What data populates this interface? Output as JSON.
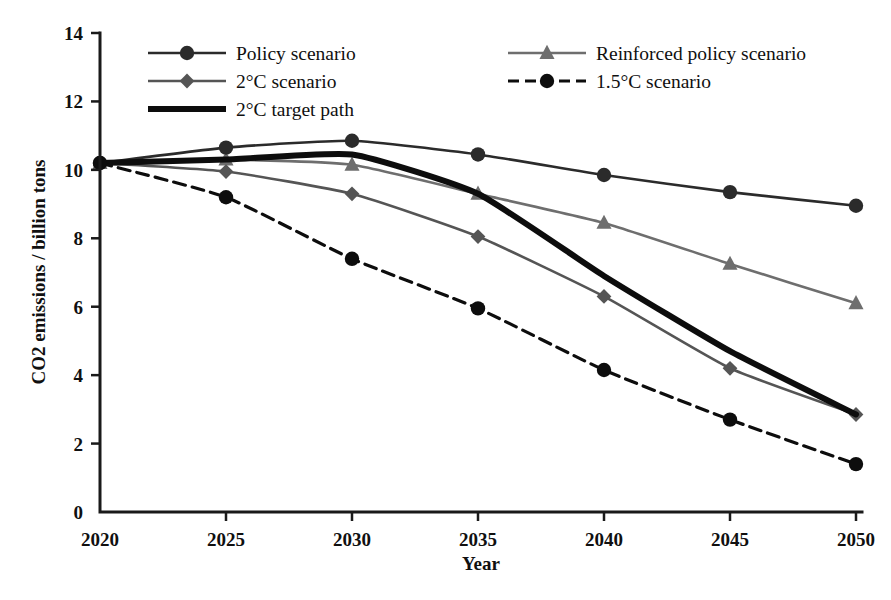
{
  "chart_data": {
    "type": "line",
    "title": "",
    "xlabel": "Year",
    "ylabel": "CO2 emissions / billion tons",
    "x": [
      2020,
      2025,
      2030,
      2035,
      2040,
      2045,
      2050
    ],
    "xticklabels": [
      "2020",
      "2025",
      "2030",
      "2035",
      "2040",
      "2045",
      "2050"
    ],
    "yticklabels": [
      "0",
      "2",
      "4",
      "6",
      "8",
      "10",
      "12",
      "14"
    ],
    "yticks": [
      0,
      2,
      4,
      6,
      8,
      10,
      12,
      14
    ],
    "xlim": [
      2020,
      2050
    ],
    "ylim": [
      0,
      14
    ],
    "grid": false,
    "legend_position": "top-inside",
    "series": [
      {
        "name": "Policy scenario",
        "values": [
          10.2,
          10.65,
          10.85,
          10.45,
          9.85,
          9.35,
          8.95
        ],
        "color": "#2b2b2b",
        "marker": "circle",
        "dash": "none",
        "width": 2.6
      },
      {
        "name": "Reinforced policy scenario",
        "values": [
          10.2,
          10.3,
          10.15,
          9.3,
          8.45,
          7.25,
          6.1
        ],
        "color": "#6e6e6e",
        "marker": "triangle",
        "dash": "none",
        "width": 2.6
      },
      {
        "name": "2°C scenario",
        "values": [
          10.2,
          9.95,
          9.3,
          8.05,
          6.3,
          4.2,
          2.85
        ],
        "color": "#555555",
        "marker": "diamond",
        "dash": "none",
        "width": 2.6
      },
      {
        "name": "2°C target path",
        "values": [
          10.2,
          10.3,
          10.45,
          9.3,
          6.9,
          4.7,
          2.85
        ],
        "color": "#0d0d0d",
        "marker": "none",
        "dash": "none",
        "width": 6
      },
      {
        "name": "1.5°C scenario",
        "values": [
          10.2,
          9.2,
          7.4,
          5.95,
          4.15,
          2.7,
          1.4
        ],
        "color": "#0d0d0d",
        "marker": "circle",
        "dash": "12,7",
        "width": 3.2
      }
    ]
  },
  "legend": {
    "entries": [
      {
        "label": "Policy scenario",
        "key": "policy-scenario"
      },
      {
        "label": "2°C scenario",
        "key": "two-degree-scenario"
      },
      {
        "label": "2°C target path",
        "key": "two-degree-target-path"
      },
      {
        "label": "Reinforced policy scenario",
        "key": "reinforced-policy-scenario"
      },
      {
        "label": "1.5°C scenario",
        "key": "one-point-five-degree-scenario"
      }
    ]
  },
  "colors": {
    "axis": "#1a1a1a",
    "text": "#101010",
    "background": "#ffffff",
    "policy": "#2b2b2b",
    "reinforced": "#6e6e6e",
    "two_degree": "#555555",
    "target_path": "#0d0d0d",
    "one_five_degree": "#0d0d0d"
  }
}
